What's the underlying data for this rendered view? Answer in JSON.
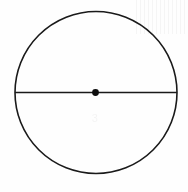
{
  "figure": {
    "background_color": "#fefefe",
    "stroke_color": "#1a1a1a",
    "canvas": {
      "width": 188,
      "height": 192
    },
    "circle": {
      "name": "circle-outline",
      "center_x": 96,
      "center_y": 92.5,
      "radius": 81,
      "stroke_width": 1.6,
      "fill": "none"
    },
    "diameter": {
      "name": "horizontal-diameter-line",
      "x1": 15,
      "y1": 92.5,
      "x2": 177,
      "y2": 92.5,
      "stroke_width": 1.6,
      "length": 162
    },
    "center_point": {
      "name": "center-point-dot",
      "cx": 95.5,
      "cy": 92.5,
      "radius": 3.4,
      "fill": "#0d0d0d"
    },
    "artifacts": {
      "ghost_text": "3",
      "streaks_label": "scan-streaks"
    }
  }
}
